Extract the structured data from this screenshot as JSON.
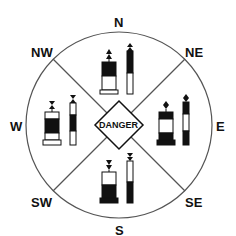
{
  "diagram": {
    "center_label": "DANGER",
    "directions": {
      "n": "N",
      "ne": "NE",
      "e": "E",
      "se": "SE",
      "s": "S",
      "sw": "SW",
      "w": "W",
      "nw": "NW"
    },
    "marks": [
      {
        "quadrant": "north",
        "topmark": "two cones pointing up",
        "pattern": "black over white"
      },
      {
        "quadrant": "east",
        "topmark": "two cones base to base",
        "pattern": "black-white-black"
      },
      {
        "quadrant": "south",
        "topmark": "two cones pointing down",
        "pattern": "white over black"
      },
      {
        "quadrant": "west",
        "topmark": "two cones point to point",
        "pattern": "white-black-white"
      }
    ],
    "colors": {
      "ink": "#111111",
      "line": "#555555",
      "background": "#ffffff"
    }
  }
}
